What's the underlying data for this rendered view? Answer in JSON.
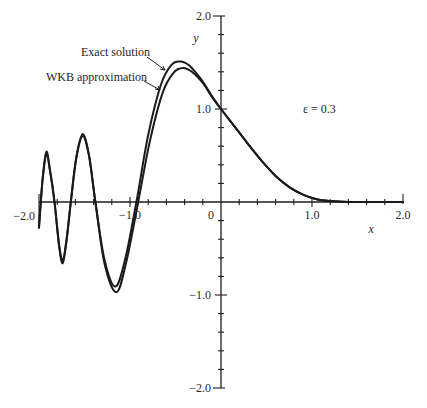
{
  "chart_data": {
    "type": "line",
    "title": "",
    "xlabel": "x",
    "ylabel": "y",
    "xlim": [
      -2.0,
      2.0
    ],
    "ylim": [
      -2.0,
      2.0
    ],
    "grid": false,
    "x_ticks": [
      {
        "value": -2.0,
        "label": "−2.0"
      },
      {
        "value": -1.0,
        "label": "−1.0"
      },
      {
        "value": 0,
        "label": "0"
      },
      {
        "value": 1.0,
        "label": "1.0"
      },
      {
        "value": 2.0,
        "label": "2.0"
      }
    ],
    "y_ticks": [
      {
        "value": 2.0,
        "label": "2.0"
      },
      {
        "value": 1.0,
        "label": "1.0"
      },
      {
        "value": -1.0,
        "label": "−1.0"
      },
      {
        "value": -2.0,
        "label": "−2.0"
      }
    ],
    "minor_tick_step": 0.2,
    "annotations": [
      {
        "text": "ε = 0.3",
        "x": 0.9,
        "y": 1.0
      }
    ],
    "series": [
      {
        "name": "Exact solution",
        "x": [
          -2.0,
          -1.96,
          -1.92,
          -1.88,
          -1.83,
          -1.78,
          -1.74,
          -1.7,
          -1.65,
          -1.59,
          -1.52,
          -1.45,
          -1.38,
          -1.28,
          -1.16,
          -1.05,
          -0.93,
          -0.8,
          -0.66,
          -0.54,
          -0.44,
          -0.34,
          -0.22,
          -0.1,
          0.0,
          0.15,
          0.3,
          0.45,
          0.6,
          0.75,
          0.9,
          1.05,
          1.2,
          1.4,
          1.6,
          2.0
        ],
        "y": [
          -0.26,
          0.25,
          0.54,
          0.35,
          0.0,
          -0.45,
          -0.63,
          -0.42,
          0.0,
          0.48,
          0.73,
          0.5,
          0.0,
          -0.62,
          -0.91,
          -0.6,
          0.0,
          0.72,
          1.26,
          1.48,
          1.51,
          1.46,
          1.32,
          1.14,
          1.0,
          0.81,
          0.62,
          0.44,
          0.28,
          0.16,
          0.08,
          0.03,
          0.01,
          0.0,
          0.0,
          0.0
        ]
      },
      {
        "name": "WKB approximation",
        "x": [
          -2.0,
          -1.96,
          -1.92,
          -1.88,
          -1.83,
          -1.78,
          -1.74,
          -1.7,
          -1.65,
          -1.59,
          -1.52,
          -1.45,
          -1.38,
          -1.28,
          -1.15,
          -1.04,
          -0.91,
          -0.78,
          -0.64,
          -0.52,
          -0.42,
          -0.32,
          -0.2,
          -0.1,
          0.0,
          0.15,
          0.3,
          0.45,
          0.6,
          0.75,
          0.9,
          1.05,
          1.2,
          1.4,
          1.6,
          2.0
        ],
        "y": [
          -0.28,
          0.24,
          0.52,
          0.34,
          0.0,
          -0.47,
          -0.66,
          -0.44,
          0.0,
          0.47,
          0.71,
          0.49,
          0.0,
          -0.66,
          -0.97,
          -0.64,
          0.0,
          0.66,
          1.18,
          1.39,
          1.44,
          1.4,
          1.28,
          1.13,
          1.0,
          0.81,
          0.62,
          0.44,
          0.28,
          0.16,
          0.08,
          0.03,
          0.01,
          0.0,
          0.0,
          0.0
        ]
      }
    ],
    "legend": [
      {
        "text": "Exact solution",
        "series": "Exact solution",
        "placement": "upper-left, arrow to curve"
      },
      {
        "text": "WKB approximation",
        "series": "WKB approximation",
        "placement": "upper-left, arrow to curve"
      }
    ]
  }
}
